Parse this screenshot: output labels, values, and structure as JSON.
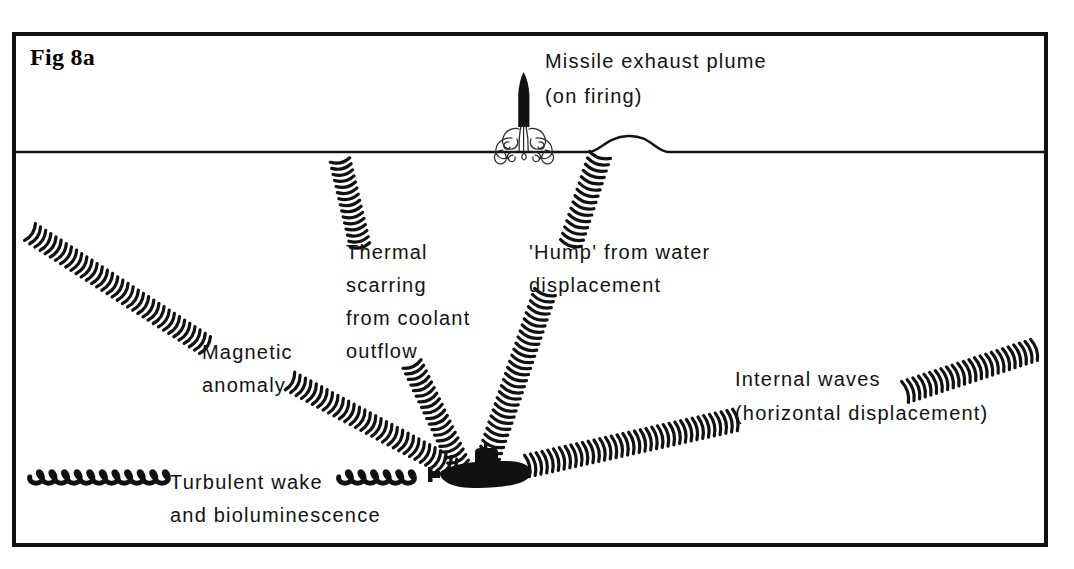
{
  "figure": {
    "id_label": "Fig 8a",
    "border_color": "#111111",
    "ink_color": "#121212",
    "background": "#ffffff"
  },
  "labels": {
    "missile_line1": "Missile exhaust plume",
    "missile_line2": "(on firing)",
    "thermal_line1": "Thermal",
    "thermal_line2": "scarring",
    "thermal_line3": "from coolant",
    "thermal_line4": "outflow",
    "hump_line1": "'Hump' from water",
    "hump_line2": "displacement",
    "magnetic_line1": "Magnetic",
    "magnetic_line2": "anomaly",
    "internal_line1": "Internal waves",
    "internal_line2": "(horizontal displacement)",
    "wake_line1": "Turbulent wake",
    "wake_line2": "and bioluminescence"
  },
  "diagram_features": [
    {
      "name": "water-surface-line",
      "description": "Sea surface horizontal line",
      "y": 152
    },
    {
      "name": "surface-hump",
      "description": "Raised bump in sea surface from water displacement"
    },
    {
      "name": "missile",
      "description": "Black missile silhouette rising above surface"
    },
    {
      "name": "exhaust-plume",
      "description": "Outlined billowing exhaust cloud at missile base"
    },
    {
      "name": "submarine",
      "description": "Black submarine silhouette with conning tower"
    },
    {
      "name": "magnetic-anomaly-band",
      "description": "Hatched wave band from upper-left to submarine"
    },
    {
      "name": "thermal-scarring-band",
      "description": "Hatched wave band from surface down to submarine"
    },
    {
      "name": "hump-band",
      "description": "Hatched wave band from surface hump down to submarine"
    },
    {
      "name": "internal-waves-band",
      "description": "Hatched wave band from submarine to upper-right"
    },
    {
      "name": "turbulent-wake-coil",
      "description": "Coiled spring trailing to the left of the submarine"
    }
  ]
}
